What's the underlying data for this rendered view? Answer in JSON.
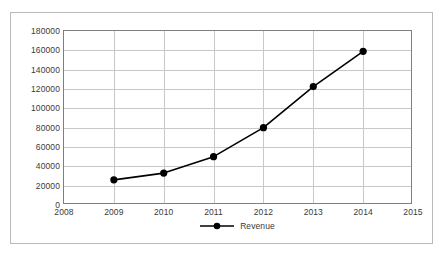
{
  "chart_data": {
    "type": "line",
    "title": "",
    "xlabel": "",
    "ylabel": "",
    "x": [
      2009,
      2010,
      2011,
      2012,
      2013,
      2014
    ],
    "categories": [
      "2009",
      "2010",
      "2011",
      "2012",
      "2013",
      "2014"
    ],
    "series": [
      {
        "name": "Revenue",
        "values": [
          26000,
          33000,
          50000,
          80000,
          122500,
          159000
        ]
      }
    ],
    "xlim": [
      2008,
      2015
    ],
    "ylim": [
      0,
      180000
    ],
    "xticks": [
      2008,
      2009,
      2010,
      2011,
      2012,
      2013,
      2014,
      2015
    ],
    "xtick_labels": [
      "2008",
      "2009",
      "2010",
      "2011",
      "2012",
      "2013",
      "2014",
      "2015"
    ],
    "yticks": [
      0,
      20000,
      40000,
      60000,
      80000,
      100000,
      120000,
      140000,
      160000,
      180000
    ],
    "ytick_labels": [
      "0",
      "20000",
      "40000",
      "60000",
      "80000",
      "100000",
      "120000",
      "140000",
      "160000",
      "180000"
    ],
    "grid": true,
    "legend": {
      "position": "bottom-center",
      "entries": [
        "Revenue"
      ],
      "marker": "filled-circle"
    },
    "colors": {
      "series_line": "#000000",
      "marker": "#000000",
      "grid": "#c8c8c8",
      "axis": "#7f7f7f",
      "frame": "#b9b9b9",
      "text": "#3a3a3a",
      "background": "#ffffff"
    }
  }
}
